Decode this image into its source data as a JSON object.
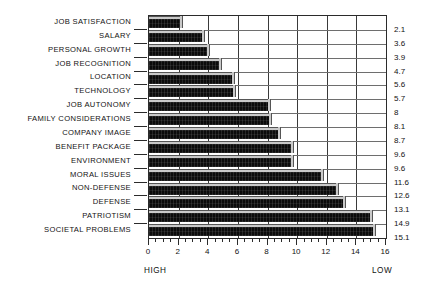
{
  "chart_data": {
    "type": "bar",
    "orientation": "horizontal",
    "title": "",
    "xlabel": "",
    "ylabel": "",
    "xlim": [
      0,
      16
    ],
    "xticks": [
      0,
      2,
      4,
      6,
      8,
      10,
      12,
      14,
      16
    ],
    "xtick_labels": [
      "0",
      "2",
      "4",
      "6",
      "8",
      "10",
      "12",
      "14",
      "16"
    ],
    "minor_tick_step": 0.5,
    "grid": "both",
    "legend": "none",
    "axis_end_labels": {
      "left": "HIGH",
      "right": "LOW"
    },
    "value_labels_position": "right",
    "categories": [
      "JOB SATISFACTION",
      "SALARY",
      "PERSONAL GROWTH",
      "JOB RECOGNITION",
      "LOCATION",
      "TECHNOLOGY",
      "JOB AUTONOMY",
      "FAMILY CONSIDERATIONS",
      "COMPANY IMAGE",
      "BENEFIT PACKAGE",
      "ENVIRONMENT",
      "MORAL ISSUES",
      "NON-DEFENSE",
      "DEFENSE",
      "PATRIOTISM",
      "SOCIETAL PROBLEMS"
    ],
    "values": [
      2.1,
      3.6,
      3.9,
      4.7,
      5.6,
      5.7,
      8,
      8.1,
      8.7,
      9.6,
      9.6,
      11.6,
      12.6,
      13.1,
      14.9,
      15.1
    ],
    "value_labels": [
      "2.1",
      "3.6",
      "3.9",
      "4.7",
      "5.6",
      "5.7",
      "8",
      "8.1",
      "8.7",
      "9.6",
      "9.6",
      "11.6",
      "12.6",
      "13.1",
      "14.9",
      "15.1"
    ],
    "bar_color": "#0b0b0b",
    "bar_highlight_color": "#c9c9c9",
    "grid_color": "#6e6e6e",
    "axis_color": "#2b2b2b",
    "background_color": "#ffffff"
  }
}
